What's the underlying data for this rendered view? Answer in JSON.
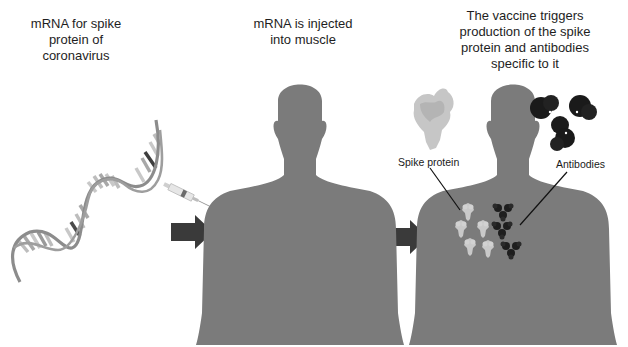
{
  "panels": [
    {
      "id": "panel-mrna",
      "caption_lines": [
        "mRNA for spike",
        "protein of",
        "coronavirus"
      ]
    },
    {
      "id": "panel-injection",
      "caption_lines": [
        "mRNA is injected",
        "into muscle"
      ]
    },
    {
      "id": "panel-response",
      "caption_lines": [
        "The vaccine triggers",
        "production of the spike",
        "protein and antibodies",
        "specific to it"
      ]
    }
  ],
  "labels": {
    "spike_protein": "Spike protein",
    "antibodies": "Antibodies"
  },
  "icons": [
    "mrna-helix-icon",
    "syringe-icon",
    "arrow-right-icon",
    "human-silhouette-icon",
    "spike-protein-icon",
    "antibody-icon"
  ],
  "colors": {
    "body": "#7b7b7b",
    "arrow": "#3a3a3a",
    "helix_strand": "#8f8f8f",
    "spike": "#c4c4c4",
    "antibody": "#202020",
    "text": "#1e1e1e"
  }
}
